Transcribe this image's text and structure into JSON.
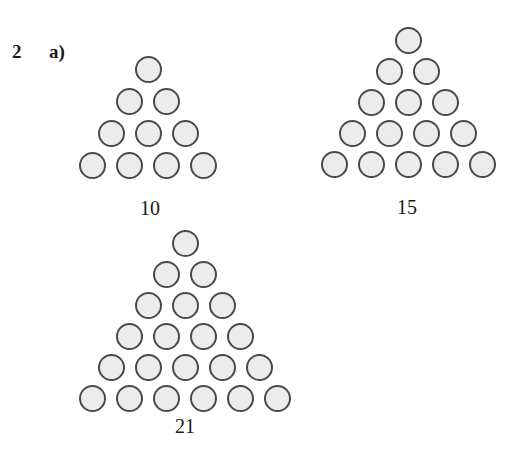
{
  "question": {
    "number": "2",
    "part": "a)"
  },
  "triangles": [
    {
      "label": "10",
      "rows": 4,
      "total": 10,
      "apex": [
        148,
        69
      ],
      "dx": 37,
      "dy": 32,
      "label_pos": [
        150,
        198
      ]
    },
    {
      "label": "15",
      "rows": 5,
      "total": 15,
      "apex": [
        408,
        40
      ],
      "dx": 37,
      "dy": 31,
      "label_pos": [
        407,
        197
      ]
    },
    {
      "label": "21",
      "rows": 6,
      "total": 21,
      "apex": [
        185,
        243
      ],
      "dx": 37,
      "dy": 31,
      "label_pos": [
        185,
        416
      ]
    }
  ],
  "colors": {
    "dot_fill": "#ececec",
    "dot_stroke": "#4a4a4a",
    "text": "#1a1a1a",
    "background": "#ffffff"
  }
}
